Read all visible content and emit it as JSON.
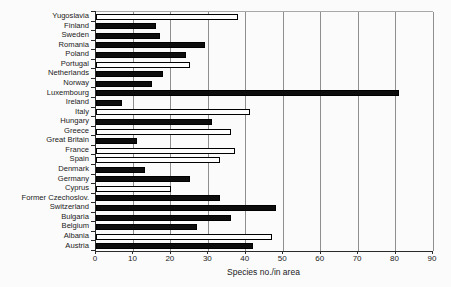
{
  "chart_data": {
    "type": "bar",
    "orientation": "horizontal",
    "title": "",
    "xlabel": "Species no./in area",
    "ylabel": "",
    "xlim": [
      0,
      90
    ],
    "xticks": [
      0,
      10,
      20,
      30,
      40,
      50,
      60,
      70,
      80,
      90
    ],
    "grid": "vertical-on",
    "legend": "none",
    "categories_top_to_bottom": [
      "Yugoslavia",
      "Finland",
      "Sweden",
      "Romania",
      "Poland",
      "Portugal",
      "Netherlands",
      "Norway",
      "Luxembourg",
      "Ireland",
      "Italy",
      "Hungary",
      "Greece",
      "Great Britain",
      "France",
      "Spain",
      "Denmark",
      "Germany",
      "Cyprus",
      "Former Czechoslov.",
      "Switzerland",
      "Bulgaria",
      "Belgium",
      "Albania",
      "Austria"
    ],
    "series": [
      {
        "name": "Species no./in area",
        "values": [
          38,
          16,
          17,
          29,
          24,
          25,
          18,
          15,
          81,
          7,
          41,
          31,
          36,
          11,
          37,
          33,
          13,
          25,
          20,
          33,
          48,
          36,
          27,
          47,
          42
        ],
        "bar_fills": [
          "white",
          "black",
          "black",
          "black",
          "black",
          "white",
          "black",
          "black",
          "black",
          "black",
          "white",
          "black",
          "white",
          "black",
          "white",
          "white",
          "black",
          "black",
          "white",
          "black",
          "black",
          "black",
          "black",
          "white",
          "black"
        ]
      }
    ]
  },
  "colors": {
    "bar_black": "#0d0d0d",
    "bar_white": "#fdfdfd",
    "bar_border": "#000000",
    "gridline": "#8f8f8f",
    "axis": "#2a2a2a",
    "text": "#222222",
    "background": "#fbfbfb"
  }
}
